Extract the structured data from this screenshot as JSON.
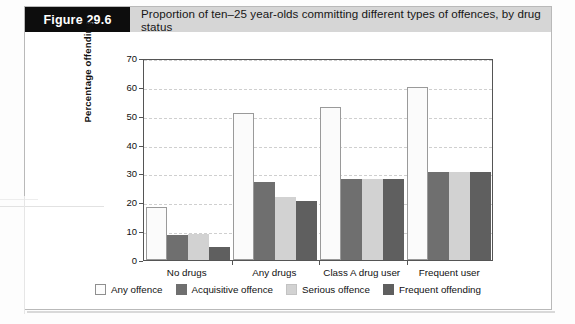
{
  "figure": {
    "tag": "Figure 29.6",
    "title": "Proportion of ten–25 year-olds committing different types of offences, by drug status"
  },
  "chart_data": {
    "type": "bar",
    "title": "Proportion of ten–25 year-olds committing different types of offences, by drug status",
    "xlabel": "",
    "ylabel": "Percentage offending",
    "ylim": [
      0,
      70
    ],
    "yticks": [
      0,
      10,
      20,
      30,
      40,
      50,
      60,
      70
    ],
    "ytick_labels": [
      "0",
      "10",
      "20",
      "30",
      "40",
      "50",
      "60",
      "70"
    ],
    "grid": true,
    "legend_position": "bottom",
    "categories": [
      "No drugs",
      "Any drugs",
      "Class A drug user",
      "Frequent user"
    ],
    "series": [
      {
        "name": "Any offence",
        "color": "#fbfbfb",
        "values": [
          18.5,
          51,
          53,
          60
        ]
      },
      {
        "name": "Acquisitive offence",
        "color": "#6f6f6f",
        "values": [
          8.5,
          27,
          28,
          30.5
        ]
      },
      {
        "name": "Serious offence",
        "color": "#d2d2d2",
        "values": [
          9,
          22,
          28,
          30.5
        ]
      },
      {
        "name": "Frequent offending",
        "color": "#5f5f5f",
        "values": [
          4.5,
          20.5,
          28,
          30.5
        ]
      }
    ]
  }
}
